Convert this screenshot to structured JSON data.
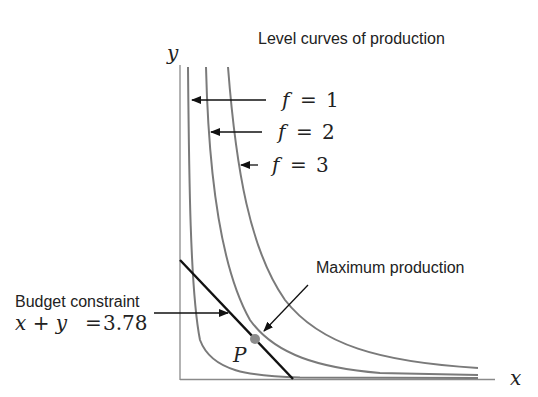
{
  "title": "Level curves of production",
  "axes": {
    "x_label": "x",
    "y_label": "y"
  },
  "level_curves": [
    {
      "id": "f1",
      "label_var": "f",
      "label_eq": "=",
      "label_val": "1"
    },
    {
      "id": "f2",
      "label_var": "f",
      "label_eq": "=",
      "label_val": "2"
    },
    {
      "id": "f3",
      "label_var": "f",
      "label_eq": "=",
      "label_val": "3"
    }
  ],
  "budget": {
    "label": "Budget constraint",
    "equation_lhs": "x + y",
    "equation_eq": "=",
    "equation_rhs": "3.78",
    "equation": "x + y = 3.78"
  },
  "optimum": {
    "label": "Maximum production",
    "point_label": "P"
  },
  "colors": {
    "curve": "#7a7a7a",
    "budget_line": "#111111",
    "axis": "#888888",
    "point": "#8c8c8c",
    "text": "#222222"
  }
}
